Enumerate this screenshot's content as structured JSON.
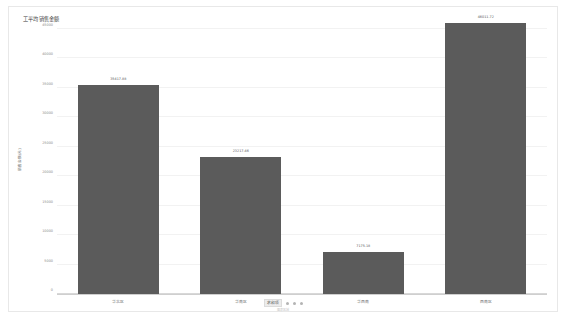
{
  "chart_data": {
    "type": "bar",
    "title": "工平均销售金额",
    "categories": [
      "华北区",
      "华南区",
      "华西南",
      "西南区"
    ],
    "values": [
      35417.88,
      23217.46,
      7175.18,
      46011.72
    ],
    "value_labels": [
      "35417.88",
      "23217.46",
      "7175.18",
      "46011.72"
    ],
    "xlabel": "",
    "ylabel": "销售金额(元)",
    "ylim": [
      0,
      45000
    ],
    "yticks": [
      0,
      5000,
      10000,
      15000,
      20000,
      25000,
      30000,
      35000,
      40000,
      45000
    ],
    "ytick_labels": [
      "0",
      "5000",
      "10000",
      "15000",
      "20000",
      "25000",
      "30000",
      "35000",
      "40000",
      "45000"
    ],
    "grid": true,
    "legend_position": "bottom",
    "bar_color": "#5b5b5b"
  },
  "legend": {
    "series_label": "求和项",
    "caption": "图表区域"
  }
}
